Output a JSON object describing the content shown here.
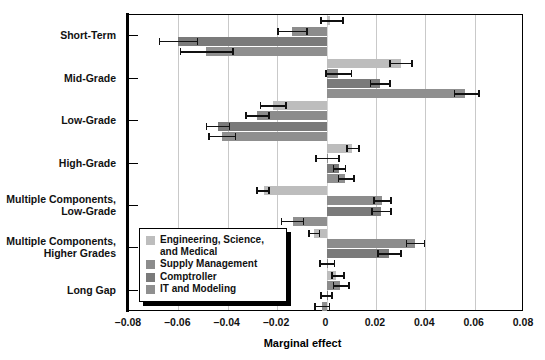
{
  "chart_data": {
    "type": "bar",
    "orientation": "horizontal",
    "title": "",
    "xlabel": "Marginal effect",
    "ylabel": "",
    "xlim": [
      -0.08,
      0.08
    ],
    "xticks": [
      -0.08,
      -0.06,
      -0.04,
      -0.02,
      0,
      0.02,
      0.04,
      0.06,
      0.08
    ],
    "xtick_labels": [
      "–0.08",
      "–0.06",
      "–0.04",
      "–0.02",
      "0",
      "0.02",
      "0.04",
      "0.06",
      "0.08"
    ],
    "grid": "vertical",
    "legend_position": "inside-lower-left",
    "categories": [
      "Short-Term",
      "Mid-Grade",
      "Low-Grade",
      "High-Grade",
      "Multiple Components,\nLow-Grade",
      "Multiple Components,\nHigher Grades",
      "Long Gap"
    ],
    "series": [
      {
        "name": "Engineering, Science, and Medical",
        "color": "#bdbdbd",
        "values": [
          0.0015,
          0.03,
          -0.0215,
          0.0105,
          -0.0255,
          -0.005,
          0.004
        ],
        "ci_low": [
          -0.0025,
          0.0255,
          -0.027,
          0.008,
          -0.0285,
          -0.0075,
          0.002
        ],
        "ci_high": [
          0.007,
          0.035,
          -0.016,
          0.0135,
          -0.023,
          -0.0025,
          0.0075
        ]
      },
      {
        "name": "Supply Management",
        "color": "#8c8c8c",
        "values": [
          -0.014,
          0.0045,
          -0.028,
          0.0005,
          0.0225,
          0.036,
          0.0055
        ],
        "ci_low": [
          -0.02,
          -0.0005,
          -0.033,
          -0.0045,
          0.019,
          0.032,
          0.0025
        ],
        "ci_high": [
          -0.0075,
          0.0105,
          -0.023,
          0.0055,
          0.0265,
          0.04,
          0.0095
        ]
      },
      {
        "name": "Comptroller",
        "color": "#7a7a7a",
        "values": [
          -0.06,
          0.0215,
          -0.044,
          0.005,
          0.022,
          0.0255,
          0.0
        ],
        "ci_low": [
          -0.068,
          0.0175,
          -0.049,
          0.0025,
          0.018,
          0.0205,
          -0.0025
        ],
        "ci_high": [
          -0.052,
          0.026,
          -0.039,
          0.008,
          0.0265,
          0.0305,
          0.0025
        ]
      },
      {
        "name": "IT and Modeling",
        "color": "#8f8f8f",
        "values": [
          -0.049,
          0.056,
          -0.0425,
          0.0075,
          -0.0135,
          0.0,
          -0.002
        ],
        "ci_low": [
          -0.0595,
          0.0515,
          -0.048,
          0.0045,
          -0.0185,
          -0.003,
          -0.005
        ],
        "ci_high": [
          -0.0375,
          0.062,
          -0.0365,
          0.0115,
          -0.009,
          0.0035,
          0.0015
        ]
      }
    ]
  },
  "axis": {
    "x_title": "Marginal effect"
  },
  "legend": {
    "items": [
      {
        "label": "Engineering, Science,\nand Medical",
        "color": "#bdbdbd"
      },
      {
        "label": "Supply Management",
        "color": "#8c8c8c"
      },
      {
        "label": "Comptroller",
        "color": "#7a7a7a"
      },
      {
        "label": "IT and Modeling",
        "color": "#8f8f8f"
      }
    ]
  }
}
